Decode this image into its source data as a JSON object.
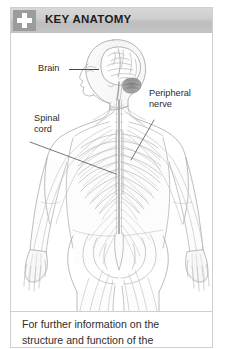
{
  "card": {
    "header": {
      "icon": "medical-cross-icon",
      "title": "KEY ANATOMY",
      "background_color": "#c8c8c8",
      "icon_box_color": "#9c9c9c",
      "icon_color": "#ffffff",
      "title_color": "#1d1d1d"
    },
    "figure": {
      "description": "Anatomical line drawing of the human nervous system shown on a front-facing body from head to upper thighs, with brain in profile view at the head, spinal cord running down the centre of the torso and peripheral nerves branching outward through the ribcage, arms, pelvis and legs.",
      "line_color": "#b4b4b4",
      "shade_color": "#8f8f8f",
      "background_color": "#ffffff",
      "labels": [
        {
          "id": "brain",
          "text": "Brain",
          "lines": [
            "Brain"
          ]
        },
        {
          "id": "spinal-cord",
          "text": "Spinal cord",
          "lines": [
            "Spinal",
            "cord"
          ]
        },
        {
          "id": "peripheral-nerve",
          "text": "Peripheral nerve",
          "lines": [
            "Peripheral",
            "nerve"
          ]
        }
      ],
      "label_color": "#2b2b2b",
      "leader_line_color": "#4a4a4a"
    },
    "footer": {
      "lines": [
        "For further information on the",
        "structure and function of the"
      ],
      "text_color": "#2e2e2e"
    }
  }
}
